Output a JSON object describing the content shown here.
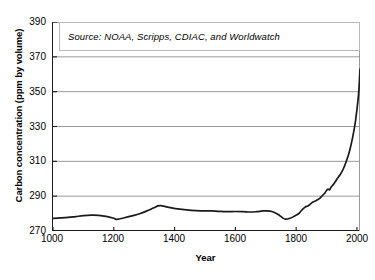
{
  "chart_data": {
    "type": "line",
    "title": "",
    "xlabel": "Year",
    "ylabel": "Carbon concentration (ppm by volume)",
    "xlim": [
      1000,
      2010
    ],
    "ylim": [
      270,
      390
    ],
    "xticks": [
      1000,
      1200,
      1400,
      1600,
      1800,
      2000
    ],
    "yticks": [
      270,
      290,
      310,
      330,
      350,
      370,
      390
    ],
    "grid": "horizontal",
    "legend": "none",
    "annotation": "Source: NOAA, Scripps, CDIAC, and Worldwatch",
    "series": [
      {
        "name": "Atmospheric carbon concentration",
        "color": "#1a1a1a",
        "x": [
          1000,
          1025,
          1050,
          1075,
          1100,
          1125,
          1150,
          1175,
          1200,
          1210,
          1235,
          1260,
          1285,
          1310,
          1330,
          1345,
          1355,
          1370,
          1390,
          1410,
          1440,
          1470,
          1500,
          1520,
          1545,
          1570,
          1600,
          1625,
          1650,
          1670,
          1690,
          1705,
          1720,
          1735,
          1745,
          1755,
          1765,
          1780,
          1795,
          1810,
          1820,
          1830,
          1838,
          1845,
          1855,
          1865,
          1875,
          1885,
          1895,
          1900,
          1905,
          1910,
          1915,
          1925,
          1935,
          1945,
          1955,
          1965,
          1975,
          1985,
          1995,
          2005,
          2010
        ],
        "y": [
          277.3,
          277.5,
          277.8,
          278.3,
          278.8,
          279.1,
          279.0,
          278.4,
          277.3,
          276.7,
          277.6,
          278.7,
          279.9,
          281.6,
          283.2,
          284.4,
          284.6,
          284.0,
          283.3,
          282.7,
          282.1,
          281.7,
          281.5,
          281.6,
          281.3,
          281.1,
          281.2,
          281.1,
          280.9,
          281.1,
          281.5,
          281.6,
          281.2,
          280.1,
          279.0,
          277.6,
          276.8,
          277.3,
          278.6,
          280.2,
          282.3,
          283.8,
          284.3,
          285.2,
          286.6,
          287.4,
          288.4,
          290.1,
          292.0,
          293.3,
          294.0,
          293.7,
          295.2,
          297.3,
          300.0,
          302.4,
          305.6,
          310.0,
          315.5,
          323.0,
          333.0,
          348.0,
          363.0
        ],
        "note_points": {
          "start_1000": 277.3,
          "medieval_peak_1350": 284.6,
          "little_ice_age_min_1755": 276.8,
          "preindustrial_1800": 279.5,
          "value_1900": 293.3,
          "value_1950": 303.0,
          "value_2000": 356.0,
          "end_2010": 384.0
        }
      }
    ]
  }
}
